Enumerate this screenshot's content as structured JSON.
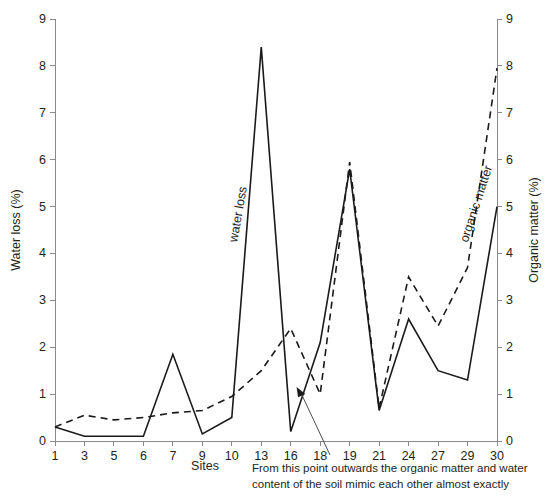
{
  "chart_data": {
    "type": "line",
    "title": "",
    "xlabel": "Sites",
    "ylabel": "Water loss (%)",
    "y2label": "Organic matter (%)",
    "categories": [
      "1",
      "3",
      "5",
      "6",
      "7",
      "9",
      "10",
      "13",
      "16",
      "18",
      "19",
      "21",
      "24",
      "27",
      "29",
      "30"
    ],
    "ylim": [
      0,
      9
    ],
    "y2lim": [
      0,
      9
    ],
    "yticks": [
      "0",
      "1",
      "2",
      "3",
      "4",
      "5",
      "6",
      "7",
      "8",
      "9"
    ],
    "y2ticks": [
      "0",
      "1",
      "2",
      "3",
      "4",
      "5",
      "6",
      "7",
      "8",
      "9"
    ],
    "grid": false,
    "legend_position": "inline",
    "series": [
      {
        "name": "water loss",
        "style": "solid",
        "axis": "left",
        "values": [
          0.3,
          0.1,
          0.1,
          0.1,
          1.85,
          0.15,
          0.5,
          8.4,
          0.2,
          2.1,
          5.8,
          0.65,
          2.6,
          1.5,
          1.3,
          5.0
        ]
      },
      {
        "name": "organic matter",
        "style": "dashed",
        "axis": "right",
        "values": [
          0.3,
          0.55,
          0.45,
          0.5,
          0.6,
          0.65,
          0.95,
          1.5,
          2.4,
          1.0,
          5.95,
          0.7,
          3.5,
          2.45,
          3.7,
          7.95
        ]
      }
    ],
    "inline_labels": [
      {
        "name": "water-loss-label",
        "text": "water loss"
      },
      {
        "name": "organic-matter-label",
        "text": "organic matter"
      }
    ],
    "annotation": {
      "line1": "From this point outwards the organic matter and water",
      "line2": "content of the soil mimic each other almost exactly",
      "points_to_site": "18"
    }
  },
  "colors": {
    "line": "#1a1a1a",
    "axis": "#8a8a8a",
    "text": "#231f20"
  }
}
